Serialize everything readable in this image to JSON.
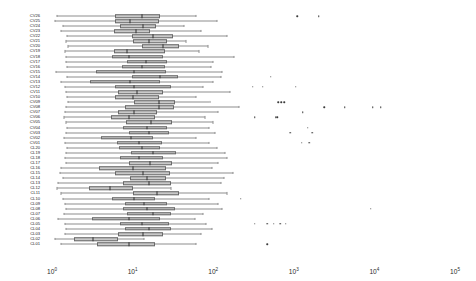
{
  "chart_data": {
    "type": "boxplot",
    "orientation": "horizontal",
    "title": "",
    "xlabel": "",
    "ylabel": "",
    "xscale": "log",
    "xlim": [
      1,
      100000
    ],
    "grid": false,
    "legend": false,
    "xticks": [
      {
        "value": 1,
        "label": "10",
        "exponent": "0"
      },
      {
        "value": 10,
        "label": "10",
        "exponent": "1"
      },
      {
        "value": 100,
        "label": "10",
        "exponent": "2"
      },
      {
        "value": 1000,
        "label": "10",
        "exponent": "3"
      },
      {
        "value": 10000,
        "label": "10",
        "exponent": "4"
      },
      {
        "value": 100000,
        "label": "10",
        "exponent": "5"
      }
    ],
    "categories": [
      "CV26",
      "CV25",
      "CV24",
      "CV23",
      "CV22",
      "CV21",
      "CV20",
      "CV19",
      "CV18",
      "CV17",
      "CV16",
      "CV15",
      "CV14",
      "CV13",
      "CV12",
      "CV11",
      "CV10",
      "CV09",
      "CV08",
      "CV07",
      "CV06",
      "CV05",
      "CV04",
      "CV03",
      "CV02",
      "CV01",
      "CL20",
      "CL19",
      "CL18",
      "CL17",
      "CL16",
      "CL15",
      "CL14",
      "CL13",
      "CL12",
      "CL11",
      "CL10",
      "CL09",
      "CL08",
      "CL07",
      "CL06",
      "CL05",
      "CL04",
      "CL03",
      "CL02",
      "CL01"
    ],
    "boxes": [
      {
        "category": "CV26",
        "whisker_low": 1.15,
        "q1": 6.0,
        "median": 13.0,
        "q3": 22.0,
        "whisker_high": 62.0,
        "outliers": [
          1100,
          2050
        ]
      },
      {
        "category": "CV25",
        "whisker_low": 1.1,
        "q1": 6.1,
        "median": 9.4,
        "q3": 21.0,
        "whisker_high": 110.0,
        "outliers": []
      },
      {
        "category": "CV24",
        "whisker_low": 1.35,
        "q1": 7.0,
        "median": 13.5,
        "q3": 19.5,
        "whisker_high": 43.0,
        "outliers": []
      },
      {
        "category": "CV23",
        "whisker_low": 1.3,
        "q1": 5.9,
        "median": 11.0,
        "q3": 16.5,
        "whisker_high": 70.0,
        "outliers": []
      },
      {
        "category": "CV22",
        "whisker_low": 1.55,
        "q1": 9.8,
        "median": 18.0,
        "q3": 32.0,
        "whisker_high": 150.0,
        "outliers": []
      },
      {
        "category": "CV21",
        "whisker_low": 1.5,
        "q1": 10.0,
        "median": 16.0,
        "q3": 27.0,
        "whisker_high": 46.0,
        "outliers": []
      },
      {
        "category": "CV20",
        "whisker_low": 1.6,
        "q1": 13.0,
        "median": 24.0,
        "q3": 38.0,
        "whisker_high": 86.0,
        "outliers": []
      },
      {
        "category": "CV19",
        "whisker_low": 1.45,
        "q1": 5.8,
        "median": 8.6,
        "q3": 25.0,
        "whisker_high": 66.0,
        "outliers": []
      },
      {
        "category": "CV18",
        "whisker_low": 1.5,
        "q1": 5.6,
        "median": 9.0,
        "q3": 24.0,
        "whisker_high": 180.0,
        "outliers": []
      },
      {
        "category": "CV17",
        "whisker_low": 1.5,
        "q1": 8.6,
        "median": 14.5,
        "q3": 27.0,
        "whisker_high": 100.0,
        "outliers": []
      },
      {
        "category": "CV16",
        "whisker_low": 1.55,
        "q1": 7.3,
        "median": 13.0,
        "q3": 25.0,
        "whisker_high": 95.0,
        "outliers": []
      },
      {
        "category": "CV15",
        "whisker_low": 1.12,
        "q1": 3.5,
        "median": 10.5,
        "q3": 26.0,
        "whisker_high": 130.0,
        "outliers": []
      },
      {
        "category": "CV14",
        "whisker_low": 1.55,
        "q1": 9.8,
        "median": 22.0,
        "q3": 37.0,
        "whisker_high": 125.0,
        "outliers": [
          520
        ]
      },
      {
        "category": "CV13",
        "whisker_low": 1.3,
        "q1": 3.0,
        "median": 9.3,
        "q3": 22.0,
        "whisker_high": 100.0,
        "outliers": []
      },
      {
        "category": "CV12",
        "whisker_low": 1.45,
        "q1": 6.0,
        "median": 10.5,
        "q3": 30.0,
        "whisker_high": 74.0,
        "outliers": [
          310,
          410,
          1050
        ]
      },
      {
        "category": "CV11",
        "whisker_low": 1.5,
        "q1": 6.5,
        "median": 11.5,
        "q3": 24.0,
        "whisker_high": 160.0,
        "outliers": []
      },
      {
        "category": "CV10",
        "whisker_low": 1.55,
        "q1": 6.0,
        "median": 10.0,
        "q3": 21.0,
        "whisker_high": 62.0,
        "outliers": []
      },
      {
        "category": "CV09",
        "whisker_low": 1.6,
        "q1": 10.5,
        "median": 21.0,
        "q3": 34.0,
        "whisker_high": 90.0,
        "outliers": [
          640,
          700,
          760
        ]
      },
      {
        "category": "CV08",
        "whisker_low": 1.5,
        "q1": 8.0,
        "median": 21.0,
        "q3": 33.0,
        "whisker_high": 210.0,
        "outliers": [
          2400,
          4300,
          9500,
          12000
        ]
      },
      {
        "category": "CV07",
        "whisker_low": 1.45,
        "q1": 6.5,
        "median": 10.5,
        "q3": 20.0,
        "whisker_high": 115.0,
        "outliers": [
          1300
        ]
      },
      {
        "category": "CV06",
        "whisker_low": 1.4,
        "q1": 5.4,
        "median": 9.0,
        "q3": 19.0,
        "whisker_high": 80.0,
        "outliers": [
          330,
          600,
          620
        ]
      },
      {
        "category": "CV05",
        "whisker_low": 1.5,
        "q1": 8.2,
        "median": 17.0,
        "q3": 31.0,
        "whisker_high": 100.0,
        "outliers": []
      },
      {
        "category": "CV04",
        "whisker_low": 1.55,
        "q1": 7.5,
        "median": 15.0,
        "q3": 27.0,
        "whisker_high": 88.0,
        "outliers": [
          1500
        ]
      },
      {
        "category": "CV03",
        "whisker_low": 1.5,
        "q1": 9.0,
        "median": 16.0,
        "q3": 28.0,
        "whisker_high": 105.0,
        "outliers": [
          900,
          1700
        ]
      },
      {
        "category": "CV02",
        "whisker_low": 1.4,
        "q1": 4.1,
        "median": 9.6,
        "q3": 18.0,
        "whisker_high": 62.0,
        "outliers": []
      },
      {
        "category": "CV01",
        "whisker_low": 1.45,
        "q1": 6.4,
        "median": 12.0,
        "q3": 23.0,
        "whisker_high": 88.0,
        "outliers": [
          1250,
          1550
        ]
      },
      {
        "category": "CL20",
        "whisker_low": 1.55,
        "q1": 6.8,
        "median": 13.0,
        "q3": 22.0,
        "whisker_high": 110.0,
        "outliers": []
      },
      {
        "category": "CL19",
        "whisker_low": 1.5,
        "q1": 9.5,
        "median": 18.0,
        "q3": 35.0,
        "whisker_high": 140.0,
        "outliers": []
      },
      {
        "category": "CL18",
        "whisker_low": 1.45,
        "q1": 7.0,
        "median": 12.0,
        "q3": 24.0,
        "whisker_high": 150.0,
        "outliers": []
      },
      {
        "category": "CL17",
        "whisker_low": 1.5,
        "q1": 9.0,
        "median": 16.5,
        "q3": 31.0,
        "whisker_high": 115.0,
        "outliers": []
      },
      {
        "category": "CL16",
        "whisker_low": 1.3,
        "q1": 3.8,
        "median": 10.0,
        "q3": 26.0,
        "whisker_high": 96.0,
        "outliers": []
      },
      {
        "category": "CL15",
        "whisker_low": 1.25,
        "q1": 6.0,
        "median": 13.5,
        "q3": 29.0,
        "whisker_high": 175.0,
        "outliers": []
      },
      {
        "category": "CL14",
        "whisker_low": 1.35,
        "q1": 9.2,
        "median": 15.0,
        "q3": 26.0,
        "whisker_high": 135.0,
        "outliers": []
      },
      {
        "category": "CL13",
        "whisker_low": 1.2,
        "q1": 7.5,
        "median": 16.0,
        "q3": 30.0,
        "whisker_high": 125.0,
        "outliers": []
      },
      {
        "category": "CL12",
        "whisker_low": 1.15,
        "q1": 2.9,
        "median": 5.3,
        "q3": 10.0,
        "whisker_high": 30.0,
        "outliers": []
      },
      {
        "category": "CL11",
        "whisker_low": 1.3,
        "q1": 10.0,
        "median": 20.0,
        "q3": 38.0,
        "whisker_high": 150.0,
        "outliers": []
      },
      {
        "category": "CL10",
        "whisker_low": 1.35,
        "q1": 5.5,
        "median": 10.5,
        "q3": 19.0,
        "whisker_high": 88.0,
        "outliers": [
          220
        ]
      },
      {
        "category": "CL09",
        "whisker_low": 1.45,
        "q1": 8.0,
        "median": 14.0,
        "q3": 27.0,
        "whisker_high": 115.0,
        "outliers": []
      },
      {
        "category": "CL08",
        "whisker_low": 1.5,
        "q1": 7.6,
        "median": 15.0,
        "q3": 34.0,
        "whisker_high": 130.0,
        "outliers": [
          9000
        ]
      },
      {
        "category": "CL07",
        "whisker_low": 1.4,
        "q1": 8.5,
        "median": 18.0,
        "q3": 30.0,
        "whisker_high": 74.0,
        "outliers": []
      },
      {
        "category": "CL06",
        "whisker_low": 1.2,
        "q1": 3.1,
        "median": 9.0,
        "q3": 22.0,
        "whisker_high": 60.0,
        "outliers": []
      },
      {
        "category": "CL05",
        "whisker_low": 1.45,
        "q1": 7.0,
        "median": 13.0,
        "q3": 28.0,
        "whisker_high": 82.0,
        "outliers": [
          330,
          470,
          560,
          680,
          800
        ]
      },
      {
        "category": "CL04",
        "whisker_low": 1.5,
        "q1": 8.0,
        "median": 16.0,
        "q3": 30.0,
        "whisker_high": 96.0,
        "outliers": []
      },
      {
        "category": "CL03",
        "whisker_low": 1.45,
        "q1": 6.5,
        "median": 13.5,
        "q3": 24.0,
        "whisker_high": 70.0,
        "outliers": []
      },
      {
        "category": "CL02",
        "whisker_low": 1.1,
        "q1": 1.9,
        "median": 3.2,
        "q3": 6.5,
        "whisker_high": 14.0,
        "outliers": []
      },
      {
        "category": "CL01",
        "whisker_low": 1.3,
        "q1": 3.6,
        "median": 9.0,
        "q3": 19.0,
        "whisker_high": 62.0,
        "outliers": [
          470
        ]
      }
    ]
  },
  "style": {
    "box_fill": "#c9c9c9",
    "box_edge": "#6a6a6a",
    "median_color": "#2e2e2e",
    "whisker_color": "#8d8d8d",
    "outlier_color": "#3a3a3a",
    "background": "#ffffff",
    "tick_label_color": "#2b2b2b",
    "category_label_color": "#1a1a1a"
  }
}
